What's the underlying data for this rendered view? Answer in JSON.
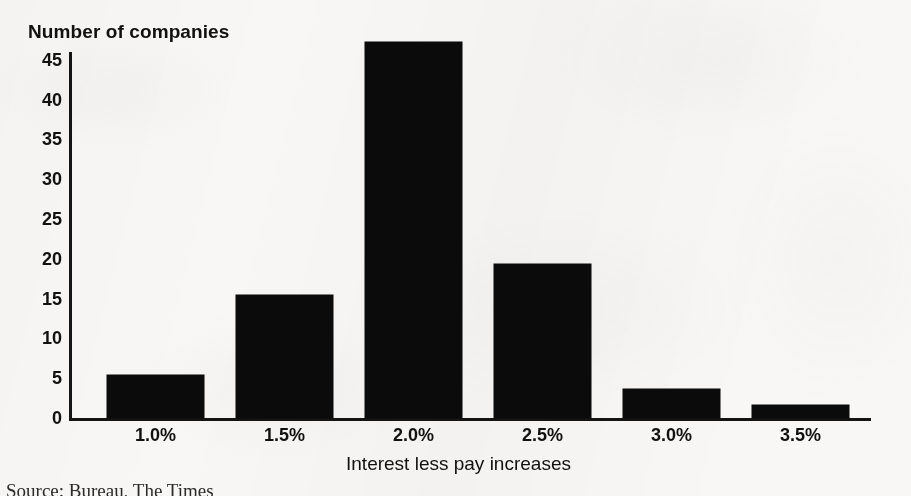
{
  "figure": {
    "background_color": "#f8f7f5",
    "ink_color": "#0b0b0b",
    "source_caption": "Source: Bureau, The Times"
  },
  "chart_data": {
    "type": "bar",
    "title": "Number of companies",
    "xlabel": "Interest less pay increases",
    "ylabel": "Number of companies",
    "categories": [
      "1.0%",
      "1.5%",
      "2.0%",
      "2.5%",
      "3.0%",
      "3.5%"
    ],
    "values": [
      5.4,
      15.5,
      47.3,
      19.4,
      3.6,
      1.6
    ],
    "ylim": [
      0,
      47.5
    ],
    "yticks": [
      45,
      40,
      35,
      30,
      25,
      20,
      15,
      10,
      5,
      0
    ],
    "ytick_labels": [
      "45",
      "40",
      "35",
      "30",
      "25",
      "20",
      "15",
      "10",
      "5",
      "0"
    ],
    "grid": false,
    "legend": false,
    "bar_color": "#0b0b0b"
  }
}
